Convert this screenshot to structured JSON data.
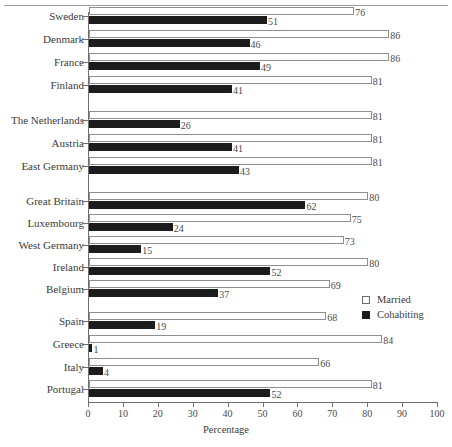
{
  "chart_data": {
    "type": "bar",
    "orientation": "horizontal",
    "title": "",
    "xlabel": "Percentage",
    "ylabel": "",
    "xlim": [
      0,
      100
    ],
    "xticks": [
      0,
      10,
      20,
      30,
      40,
      50,
      60,
      70,
      80,
      90,
      100
    ],
    "grid": false,
    "legend_position": "right-middle",
    "categories": [
      "Sweden",
      "Denmark",
      "France",
      "Finland",
      "The Netherlands",
      "Austria",
      "East Germany",
      "Great Britain",
      "Luxembourg",
      "West Germany",
      "Ireland",
      "Belgium",
      "Spain",
      "Greece",
      "Italy",
      "Portugal"
    ],
    "groups": [
      {
        "countries": [
          "Sweden",
          "Denmark",
          "France",
          "Finland"
        ]
      },
      {
        "countries": [
          "The Netherlands",
          "Austria",
          "East Germany"
        ]
      },
      {
        "countries": [
          "Great Britain",
          "Luxembourg",
          "West Germany",
          "Ireland",
          "Belgium"
        ]
      },
      {
        "countries": [
          "Spain",
          "Greece",
          "Italy",
          "Portugal"
        ]
      }
    ],
    "series": [
      {
        "name": "Married",
        "color": "#ffffff",
        "values": [
          76,
          86,
          86,
          81,
          81,
          81,
          81,
          80,
          75,
          73,
          80,
          69,
          68,
          84,
          66,
          81
        ]
      },
      {
        "name": "Cohabiting",
        "color": "#1c1c1c",
        "values": [
          51,
          46,
          49,
          41,
          26,
          41,
          43,
          62,
          24,
          15,
          52,
          37,
          19,
          1,
          4,
          52
        ]
      }
    ]
  },
  "legend": {
    "items": [
      {
        "label": "Married",
        "swatch": "open-square"
      },
      {
        "label": "Cohabiting",
        "swatch": "filled-square"
      }
    ]
  },
  "axis": {
    "x_title": "Percentage",
    "tick_labels": [
      "0",
      "10",
      "20",
      "30",
      "40",
      "50",
      "60",
      "70",
      "80",
      "90",
      "100"
    ]
  },
  "rows": [
    {
      "label": "Sweden",
      "married": 76,
      "cohabiting": 51,
      "y": 15,
      "group": 0
    },
    {
      "label": "Denmark",
      "married": 86,
      "cohabiting": 46,
      "y": 38,
      "group": 0
    },
    {
      "label": "France",
      "married": 86,
      "cohabiting": 49,
      "y": 61,
      "group": 0
    },
    {
      "label": "Finland",
      "married": 81,
      "cohabiting": 41,
      "y": 84,
      "group": 0
    },
    {
      "label": "The Netherlands",
      "married": 81,
      "cohabiting": 26,
      "y": 119,
      "group": 1
    },
    {
      "label": "Austria",
      "married": 81,
      "cohabiting": 41,
      "y": 142,
      "group": 1
    },
    {
      "label": "East Germany",
      "married": 81,
      "cohabiting": 43,
      "y": 165,
      "group": 1
    },
    {
      "label": "Great Britain",
      "married": 80,
      "cohabiting": 62,
      "y": 200,
      "group": 2
    },
    {
      "label": "Luxembourg",
      "married": 75,
      "cohabiting": 24,
      "y": 222,
      "group": 2
    },
    {
      "label": "West Germany",
      "married": 73,
      "cohabiting": 15,
      "y": 244,
      "group": 2
    },
    {
      "label": "Ireland",
      "married": 80,
      "cohabiting": 52,
      "y": 266,
      "group": 2
    },
    {
      "label": "Belgium",
      "married": 69,
      "cohabiting": 37,
      "y": 288,
      "group": 2
    },
    {
      "label": "Spain",
      "married": 68,
      "cohabiting": 19,
      "y": 320,
      "group": 3
    },
    {
      "label": "Greece",
      "married": 84,
      "cohabiting": 1,
      "y": 343,
      "group": 3
    },
    {
      "label": "Italy",
      "married": 66,
      "cohabiting": 4,
      "y": 366,
      "group": 3
    },
    {
      "label": "Portugal",
      "married": 81,
      "cohabiting": 52,
      "y": 388,
      "group": 3
    }
  ],
  "geometry": {
    "plot_left": 88,
    "plot_right": 437,
    "px_per_unit": 3.49,
    "bar_height": 8,
    "axis_top": 12,
    "axis_bottom": 402
  }
}
